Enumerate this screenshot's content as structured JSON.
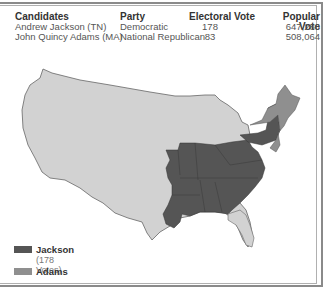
{
  "table": {
    "headers": [
      "Candidates",
      "Party",
      "Electoral Vote",
      "Popular Vote"
    ],
    "rows": [
      {
        "candidate": "Andrew Jackson (TN)",
        "party": "Democratic",
        "electoral": "178",
        "popular": "647,286"
      },
      {
        "candidate": "John Quincy Adams (MA)",
        "party": "National Republican",
        "electoral": "83",
        "popular": "508,064"
      }
    ]
  },
  "legend": {
    "items": [
      {
        "label": "Jackson",
        "sub": "(178 Votes)",
        "color": "#555555"
      },
      {
        "label": "Adams",
        "color": "#8f8f8f"
      }
    ]
  },
  "map": {
    "colors": {
      "jackson": "#555555",
      "adams": "#8f8f8f",
      "territory": "#d2d2d2",
      "outline": "#666666"
    }
  }
}
